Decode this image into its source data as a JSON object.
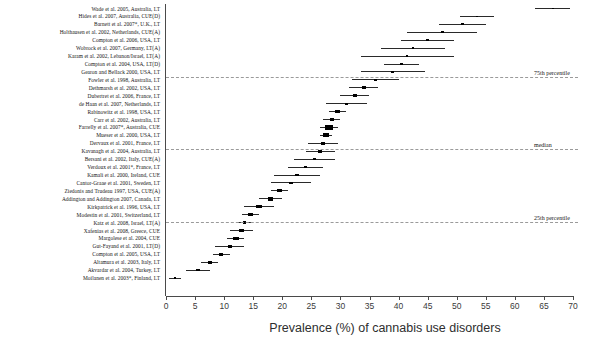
{
  "figure": {
    "type": "forest-plot",
    "background": "#ffffff",
    "marker_color": "#000000",
    "ci_color": "#2a2a2a",
    "reference_line_color": "#9a9a9a"
  },
  "axis": {
    "xlabel": "Prevalence (%) of cannabis use disorders",
    "x_min": 0,
    "x_max": 70,
    "tick_step": 5,
    "ticks": [
      0,
      5,
      10,
      15,
      20,
      25,
      30,
      35,
      40,
      45,
      50,
      55,
      60,
      65,
      70
    ],
    "tick_labels": [
      "0",
      "5",
      "10",
      "15",
      "20",
      "25",
      "30",
      "35",
      "40",
      "45",
      "50",
      "55",
      "60",
      "65",
      "70"
    ]
  },
  "reference_lines": [
    {
      "label": "75th percentile",
      "value": 40.0
    },
    {
      "label": "median",
      "value": 27.5
    },
    {
      "label": "25th percentile",
      "value": 13.5
    }
  ],
  "chart_data": {
    "type": "scatter",
    "title": "",
    "xlabel": "Prevalence (%) of cannabis use disorders",
    "ylabel": "",
    "xlim": [
      0,
      70
    ],
    "grid": false,
    "legend": "none",
    "categories": [
      "Wade et al. 2005, Australia, LT",
      "Hides et al. 2007, Australia, CUE(D)",
      "Barnett et al. 2007*, U.K., LT",
      "Holthausen et al. 2002, Netherlands, CUE(A)",
      "Compton et al. 2006, USA, LT",
      "Wobrock et al. 2007, Germany, LT(A)",
      "Karam et al. 2002, Lebanon/Israel, LT(A)",
      "Compton et al. 2004, USA, LT(D)",
      "Gearon and Bellack 2000, USA, LT",
      "Fowler et al. 1998, Australia, LT",
      "Dethmarsh et al. 2002, USA, LT",
      "Dubertret et al. 2006, France, LT",
      "de Haan et al. 2007, Netherlands, LT",
      "Rabinowitz et al. 1998, USA, LT",
      "Carr et al. 2002, Australia, LT",
      "Farrelly et al. 2007*, Australia, CUE",
      "Mueser et al. 2000, USA, LT",
      "Dervaux et al. 2001, France, LT",
      "Kavanagh et al. 2004, Australia, LT",
      "Bersani et al. 2002, Italy, CUE(A)",
      "Verdoux et al. 2001*, France, LT",
      "Kamali et al. 2000, Ireland, CUE",
      "Cantor-Graae et al. 2001, Sweden, LT",
      "Ziedonis and Trudeau 1997, USA, CUE(A)",
      "Addington and Addington 2007, Canada, LT",
      "Kirkpatrick et al. 1996, USA, LT",
      "Modestin et al. 2001, Switzerland, LT",
      "Katz et al. 2008, Israel, LT(A)",
      "Xafenias et al. 2008, Greece, CUE",
      "Margolese et al. 2004, CUE",
      "Gut-Fayand et al. 2001, LT(D)",
      "Compton et al. 2005, USA, LT",
      "Altamura et al. 2003, Italy, LT",
      "Akvardar et al. 2004, Turkey, LT",
      "Moilanen et al. 2003*, Finland, LT"
    ],
    "values": [
      66.5,
      53.5,
      51.0,
      47.5,
      45.0,
      42.5,
      41.5,
      40.5,
      39.0,
      36.0,
      34.0,
      32.5,
      31.0,
      29.5,
      28.5,
      28.0,
      27.5,
      27.0,
      26.5,
      25.5,
      24.0,
      22.5,
      21.5,
      19.5,
      18.0,
      16.0,
      14.5,
      13.5,
      13.0,
      12.0,
      11.0,
      9.5,
      7.5,
      5.5,
      1.5
    ],
    "ci_lower": [
      63.5,
      50.5,
      47.0,
      41.5,
      40.5,
      37.0,
      33.5,
      37.5,
      33.5,
      32.0,
      31.5,
      30.0,
      27.5,
      28.0,
      27.0,
      26.5,
      26.5,
      24.5,
      24.0,
      22.0,
      21.0,
      18.5,
      18.0,
      18.0,
      16.0,
      13.5,
      13.0,
      12.0,
      11.0,
      10.5,
      8.5,
      8.0,
      6.0,
      3.5,
      0.5
    ],
    "ci_upper": [
      69.5,
      56.5,
      55.0,
      53.5,
      49.5,
      48.0,
      49.5,
      43.5,
      44.5,
      40.0,
      36.5,
      35.0,
      34.5,
      31.0,
      30.0,
      29.5,
      28.5,
      29.5,
      29.0,
      29.0,
      27.0,
      26.5,
      25.0,
      21.0,
      20.0,
      18.5,
      16.0,
      15.0,
      15.0,
      13.5,
      13.5,
      11.0,
      9.0,
      7.5,
      2.5
    ],
    "marker_sizes": [
      1.8,
      2.2,
      2.0,
      2.4,
      2.6,
      2.2,
      1.8,
      2.8,
      2.2,
      2.6,
      3.2,
      3.0,
      2.2,
      3.4,
      3.2,
      6.0,
      4.6,
      3.4,
      3.4,
      2.8,
      3.0,
      2.8,
      3.2,
      3.8,
      4.2,
      4.2,
      3.6,
      3.0,
      4.2,
      4.8,
      3.8,
      3.6,
      3.2,
      2.8,
      1.8
    ]
  }
}
